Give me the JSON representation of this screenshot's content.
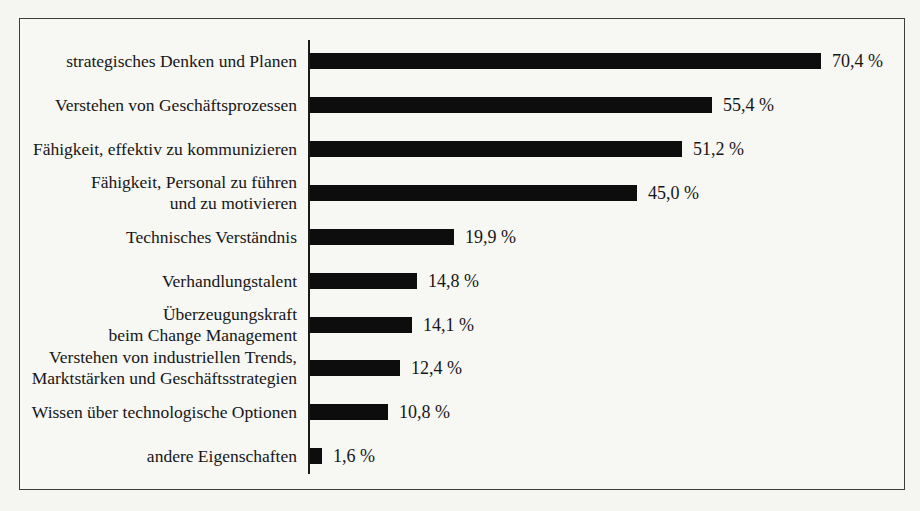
{
  "chart_data": {
    "type": "bar",
    "orientation": "horizontal",
    "title": "",
    "xlabel": "",
    "ylabel": "",
    "xlim": [
      0,
      75
    ],
    "grid": false,
    "legend": false,
    "bar_color": "#0d0d0d",
    "categories": [
      "strategisches Denken und Planen",
      "Verstehen von Geschäftsprozessen",
      "Fähigkeit, effektiv zu kommunizieren",
      "Fähigkeit, Personal zu führen und zu motivieren",
      "Technisches Verständnis",
      "Verhandlungstalent",
      "Überzeugungskraft beim Change Management",
      "Verstehen von industriellen Trends, Marktstärken und Geschäftsstrategien",
      "Wissen über technologische Optionen",
      "andere Eigenschaften"
    ],
    "label_lines": [
      [
        "strategisches Denken und Planen"
      ],
      [
        "Verstehen von Geschäftsprozessen"
      ],
      [
        "Fähigkeit, effektiv zu kommunizieren"
      ],
      [
        "Fähigkeit, Personal zu führen",
        "und zu motivieren"
      ],
      [
        "Technisches Verständnis"
      ],
      [
        "Verhandlungstalent"
      ],
      [
        "Überzeugungskraft",
        "beim Change Management"
      ],
      [
        "Verstehen von industriellen Trends,",
        "Marktstärken und Geschäftsstrategien"
      ],
      [
        "Wissen über technologische Optionen"
      ],
      [
        "andere Eigenschaften"
      ]
    ],
    "values": [
      70.4,
      55.4,
      51.2,
      45.0,
      19.9,
      14.8,
      14.1,
      12.4,
      10.8,
      1.6
    ],
    "value_labels": [
      "70,4 %",
      "55,4 %",
      "51,2 %",
      "45,0 %",
      "19,9 %",
      "14,8 %",
      "14,1 %",
      "12,4 %",
      "10,8 %",
      "1,6 %"
    ]
  },
  "layout_values": {
    "row_centers": [
      42,
      86,
      130,
      174,
      218,
      262,
      306,
      349,
      393,
      437
    ],
    "px_per_percent": 7.26,
    "bar_left": 290,
    "value_gap": 11
  }
}
